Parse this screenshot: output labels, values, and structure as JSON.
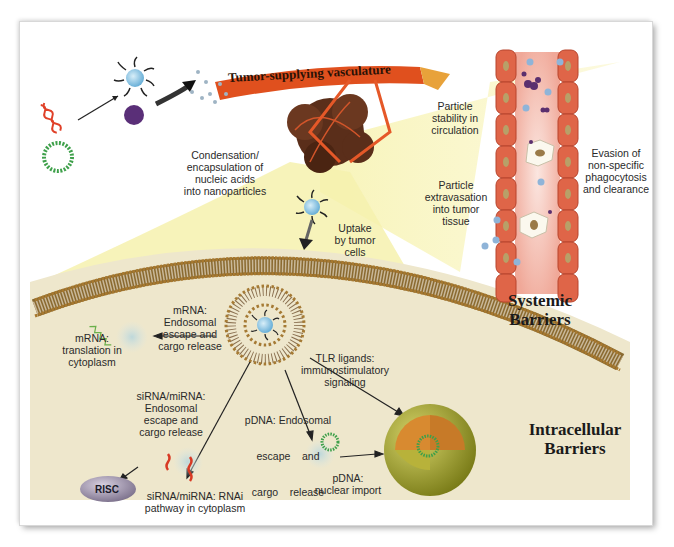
{
  "figure": {
    "banner": "Tumor-supplying vasculature",
    "sections": {
      "systemic": "Systemic Barriers",
      "intracellular": "Intracellular Barriers"
    },
    "labels": {
      "condensation": [
        "Condensation/",
        "encapsulation of",
        "nucleic acids",
        "into nanoparticles"
      ],
      "stability": [
        "Particle",
        "stability in",
        "circulation"
      ],
      "extravasation": [
        "Particle",
        "extravasation",
        "into tumor",
        "tissue"
      ],
      "evasion": [
        "Evasion of",
        "non-specific",
        "phagocytosis",
        "and clearance"
      ],
      "uptake": [
        "Uptake",
        "by tumor",
        "cells"
      ],
      "mrna_escape": [
        "mRNA:",
        "Endosomal",
        "escape and",
        "cargo release"
      ],
      "mrna_translation": [
        "mRNA:",
        "translation in",
        "cytoplasm"
      ],
      "tlr": [
        "TLR ligands:",
        "immunostimulatory",
        "signaling"
      ],
      "sirna_escape": [
        "siRNA/miRNA:",
        "Endosomal",
        "escape and",
        "cargo release"
      ],
      "pdna_escape": [
        "pDNA: Endosomal",
        "escape    and",
        "cargo    release"
      ],
      "sirna_rnai": [
        "siRNA/miRNA: RNAi",
        "pathway in cytoplasm"
      ],
      "pdna_import": [
        "pDNA:",
        "nuclear import"
      ],
      "risc": "RISC"
    },
    "colors": {
      "yellow_beam": "#f5f0a0",
      "cytoplasm": "#efe8cf",
      "vessel_cell": "#e0674a",
      "banner": "#e0501e",
      "nucleus": "#a6a82a",
      "nanoparticle_core": "#8ec8e8",
      "risc": "#9a8fa8"
    }
  }
}
